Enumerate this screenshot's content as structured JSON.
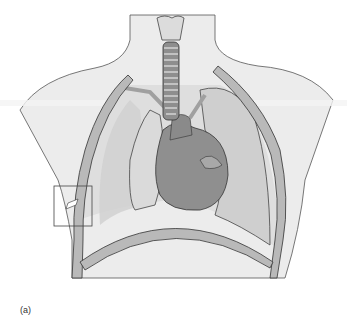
{
  "figure": {
    "caption": "(a)",
    "highlight_box": "rib-fracture-detail"
  },
  "colors": {
    "skin": "#ececec",
    "bone": "#b9b9b9",
    "bone_dark": "#9a9a9a",
    "lung": "#d2d2d2",
    "heart": "#8f8f8f",
    "heart_light": "#a8a8a8",
    "outline": "#3a3a3a"
  }
}
